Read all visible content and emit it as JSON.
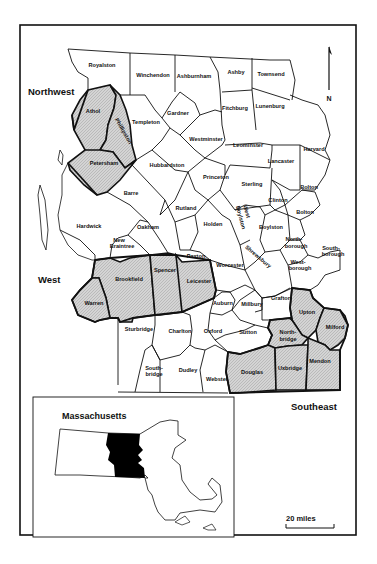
{
  "map": {
    "regions": {
      "northwest": "Northwest",
      "west": "West",
      "southeast": "Southeast"
    },
    "north_arrow": {
      "label": "N",
      "icon": "north-arrow-icon"
    },
    "scale_bar": {
      "label": "20 miles"
    },
    "inset": {
      "title": "Massachusetts",
      "highlight_color": "#000000"
    },
    "shaded_pattern_color": "#c8c8c8",
    "towns": [
      {
        "name": "Royalston",
        "shaded": false
      },
      {
        "name": "Winchendon",
        "shaded": false
      },
      {
        "name": "Ashburnham",
        "shaded": false
      },
      {
        "name": "Ashby",
        "shaded": false
      },
      {
        "name": "Townsend",
        "shaded": false
      },
      {
        "name": "Athol",
        "shaded": true
      },
      {
        "name": "Phillipston",
        "shaded": true
      },
      {
        "name": "Templeton",
        "shaded": false
      },
      {
        "name": "Gardner",
        "shaded": false
      },
      {
        "name": "Fitchburg",
        "shaded": false
      },
      {
        "name": "Lunenburg",
        "shaded": false
      },
      {
        "name": "Westminster",
        "shaded": false
      },
      {
        "name": "Leominster",
        "shaded": false
      },
      {
        "name": "Harvard",
        "shaded": false
      },
      {
        "name": "Lancaster",
        "shaded": false
      },
      {
        "name": "Petersham",
        "shaded": true
      },
      {
        "name": "Hubbardston",
        "shaded": false
      },
      {
        "name": "Princeton",
        "shaded": false
      },
      {
        "name": "Sterling",
        "shaded": false
      },
      {
        "name": "Bolton",
        "shaded": false
      },
      {
        "name": "Clinton",
        "shaded": false
      },
      {
        "name": "Berlin",
        "shaded": false
      },
      {
        "name": "Barre",
        "shaded": false
      },
      {
        "name": "Rutland",
        "shaded": false
      },
      {
        "name": "West Boylston",
        "shaded": false
      },
      {
        "name": "Boylston",
        "shaded": false
      },
      {
        "name": "Hardwick",
        "shaded": false
      },
      {
        "name": "Oakham",
        "shaded": false
      },
      {
        "name": "Holden",
        "shaded": false
      },
      {
        "name": "Northborough",
        "shaded": false
      },
      {
        "name": "Southborough",
        "shaded": false
      },
      {
        "name": "New Braintree",
        "shaded": false
      },
      {
        "name": "Shrewsbury",
        "shaded": false
      },
      {
        "name": "Westborough",
        "shaded": false
      },
      {
        "name": "Brookfield",
        "shaded": true
      },
      {
        "name": "Spencer",
        "shaded": true
      },
      {
        "name": "Paxton",
        "shaded": false
      },
      {
        "name": "Leicester",
        "shaded": true
      },
      {
        "name": "Worcester",
        "shaded": false
      },
      {
        "name": "Warren",
        "shaded": true
      },
      {
        "name": "Auburn",
        "shaded": false
      },
      {
        "name": "Millbury",
        "shaded": false
      },
      {
        "name": "Grafton",
        "shaded": false
      },
      {
        "name": "Upton",
        "shaded": true
      },
      {
        "name": "Milford",
        "shaded": true
      },
      {
        "name": "Sturbridge",
        "shaded": false
      },
      {
        "name": "Charlton",
        "shaded": false
      },
      {
        "name": "Oxford",
        "shaded": false
      },
      {
        "name": "Sutton",
        "shaded": false
      },
      {
        "name": "Northbridge",
        "shaded": true
      },
      {
        "name": "Southbridge",
        "shaded": false
      },
      {
        "name": "Dudley",
        "shaded": false
      },
      {
        "name": "Webster",
        "shaded": false
      },
      {
        "name": "Douglas",
        "shaded": true
      },
      {
        "name": "Uxbridge",
        "shaded": true
      },
      {
        "name": "Mendon",
        "shaded": true
      }
    ],
    "labels": {
      "royalston": "Royalston",
      "winchendon": "Winchendon",
      "ashburnham": "Ashburnham",
      "ashby": "Ashby",
      "townsend": "Townsend",
      "athol": "Athol",
      "phillipston": "Phillipston",
      "templeton": "Templeton",
      "gardner": "Gardner",
      "fitchburg": "Fitchburg",
      "lunenburg": "Lunenburg",
      "westminster": "Westminster",
      "leominster": "Leominster",
      "harvard": "Harvard",
      "lancaster": "Lancaster",
      "petersham": "Petersham",
      "hubbardston": "Hubbardston",
      "princeton": "Princeton",
      "sterling": "Sterling",
      "bolton": "Bolton",
      "clinton": "Clinton",
      "berlin": "Bolton",
      "barre": "Barre",
      "rutland": "Rutland",
      "west_boylston_1": "West",
      "west_boylston_2": "Boylston",
      "boylston": "Boylston",
      "hardwick": "Hardwick",
      "oakham": "Oakham",
      "holden": "Holden",
      "northborough_1": "North-",
      "northborough_2": "borough",
      "southborough_1": "South-",
      "southborough_2": "borough",
      "new_braintree_1": "New",
      "new_braintree_2": "Braintree",
      "shrewsbury": "Shrewsbury",
      "westborough_1": "West-",
      "westborough_2": "borough",
      "brookfield": "Brookfield",
      "spencer": "Spencer",
      "paxton": "Paxton",
      "leicester": "Leicester",
      "worcester": "Worcester",
      "warren": "Warren",
      "auburn": "Auburn",
      "millbury": "Millbury",
      "grafton": "Grafton",
      "upton": "Upton",
      "milford": "Milford",
      "sturbridge": "Sturbridge",
      "charlton": "Charlton",
      "oxford": "Oxford",
      "sutton": "Sutton",
      "northbridge_1": "North-",
      "northbridge_2": "bridge",
      "southbridge_1": "South-",
      "southbridge_2": "bridge",
      "dudley": "Dudley",
      "webster": "Webster",
      "douglas": "Douglas",
      "uxbridge": "Uxbridge",
      "mendon": "Mendon"
    }
  }
}
